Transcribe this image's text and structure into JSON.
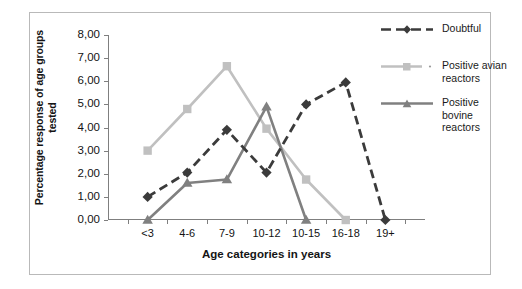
{
  "chart": {
    "type": "line",
    "title": "",
    "xlabel": "Age categories in years",
    "ylabel": "Percentage response of age groups\ntested",
    "ylim": [
      0,
      8
    ],
    "ytick_labels": [
      "0,00",
      "1,00",
      "2,00",
      "3,00",
      "4,00",
      "5,00",
      "6,00",
      "7,00",
      "8,00"
    ],
    "grid": false,
    "legend_position": "right"
  },
  "chart_data": {
    "type": "line",
    "title": "",
    "xlabel": "Age categories in years",
    "ylabel": "Percentage response of age groups tested",
    "ylim": [
      0,
      8
    ],
    "ystep": 1,
    "grid": false,
    "legend_position": "right",
    "categories": [
      "<3",
      "4-6",
      "7-9",
      "10-12",
      "10-15",
      "16-18",
      "19+"
    ],
    "ytick_labels": [
      "0,00",
      "1,00",
      "2,00",
      "3,00",
      "4,00",
      "5,00",
      "6,00",
      "7,00",
      "8,00"
    ],
    "series": [
      {
        "name": "Doubtful",
        "color": "#3b3b3b",
        "marker": "diamond",
        "dash": "dashed",
        "values": [
          1.0,
          2.05,
          3.9,
          2.05,
          5.0,
          5.95,
          0.0
        ]
      },
      {
        "name": "Positive avian reactors",
        "color": "#c0c0c0",
        "marker": "square",
        "dash": "solid",
        "values": [
          3.0,
          4.8,
          6.65,
          3.95,
          1.75,
          0.0,
          null
        ]
      },
      {
        "name": "Positive bovine reactors",
        "color": "#808080",
        "marker": "triangle",
        "dash": "solid",
        "values": [
          0.0,
          1.6,
          1.75,
          4.9,
          0.0,
          null,
          null
        ]
      }
    ]
  },
  "legend": {
    "entries": [
      {
        "label": "Doubtful"
      },
      {
        "label": "Positive avian\nreactors"
      },
      {
        "label": "Positive bovine\nreactors"
      }
    ]
  },
  "colors": {
    "doubtful": "#3b3b3b",
    "avian": "#c0c0c0",
    "bovine": "#808080",
    "axis": "#7f7f7f",
    "frame": "#b9b9b9",
    "background": "#ffffff",
    "text": "#141414"
  }
}
